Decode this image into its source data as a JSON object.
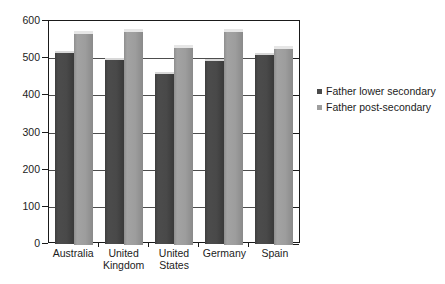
{
  "chart_data": {
    "type": "bar",
    "title": "",
    "subtitle": "",
    "xlabel": "",
    "ylabel": "",
    "ylim": [
      0,
      600
    ],
    "ytick_step": 100,
    "yticks": [
      "600",
      "500",
      "400",
      "300",
      "200",
      "100",
      "0"
    ],
    "grid": true,
    "legend_position": "right",
    "categories": [
      "Australia",
      "United Kingdom",
      "United States",
      "Germany",
      "Spain"
    ],
    "category_lines": [
      [
        "Australia"
      ],
      [
        "United",
        "Kingdom"
      ],
      [
        "United",
        "States"
      ],
      [
        "Germany"
      ],
      [
        "Spain"
      ]
    ],
    "series": [
      {
        "name": "Father lower secondary",
        "color": "#4a4a4a",
        "values": [
          513,
          495,
          457,
          492,
          509
        ]
      },
      {
        "name": "Father post-secondary",
        "color": "#9e9e9e",
        "values": [
          568,
          572,
          531,
          572,
          528
        ]
      }
    ]
  },
  "legend": {
    "items": [
      {
        "label": "Father lower secondary",
        "swatch": "dark"
      },
      {
        "label": "Father post-secondary",
        "swatch": "light"
      }
    ]
  },
  "colors": {
    "series_dark": "#4a4a4a",
    "series_light": "#9e9e9e",
    "axis": "#1a1a1a",
    "grid": "#4d4d4d",
    "background": "#ffffff"
  }
}
